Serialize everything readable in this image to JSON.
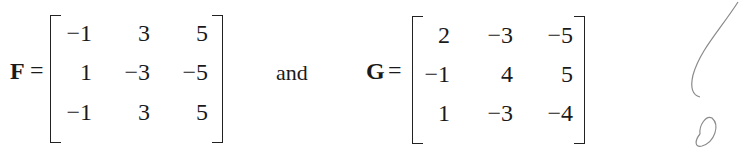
{
  "equation": {
    "matrix_f": {
      "name": "F",
      "rows": [
        [
          "−1",
          "3",
          "5"
        ],
        [
          "1",
          "−3",
          "−5"
        ],
        [
          "−1",
          "3",
          "5"
        ]
      ]
    },
    "conjunction": "and",
    "matrix_g": {
      "name": "G",
      "rows": [
        [
          "2",
          "−3",
          "−5"
        ],
        [
          "−1",
          "4",
          "5"
        ],
        [
          "1",
          "−3",
          "−4"
        ]
      ]
    },
    "equals_sign": "="
  },
  "annotation": {
    "handwritten_mark": "pencil-scribble"
  }
}
